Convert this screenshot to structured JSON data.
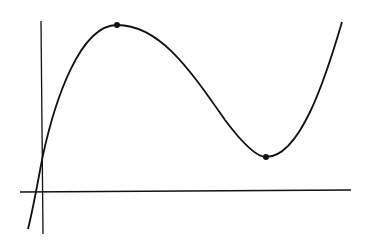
{
  "diagram": {
    "type": "cubic-function-graph",
    "colors": {
      "background": "#ffffff",
      "stroke": "#111111"
    },
    "axes": {
      "x_axis": {
        "x1": 20,
        "y1": 192,
        "x2": 351,
        "y2": 190
      },
      "y_axis": {
        "x1": 41,
        "y1": 21,
        "x2": 43,
        "y2": 234
      }
    },
    "curve": {
      "path": "M 28 229 C 34 205, 38 180, 43 155 C 55 100, 80 25, 117 25 C 160 25, 190 70, 225 120 C 240 140, 255 157, 266 157 C 300 157, 325 80, 342 22"
    },
    "points": [
      {
        "name": "local-maximum",
        "x": 117,
        "y": 25
      },
      {
        "name": "local-minimum",
        "x": 266,
        "y": 157
      }
    ]
  }
}
